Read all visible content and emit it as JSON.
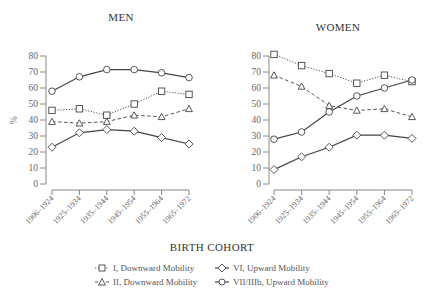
{
  "chart_data": [
    {
      "type": "line",
      "title": "MEN",
      "xlabel": "BIRTH COHORT",
      "ylabel": "%",
      "ylim": [
        0,
        80
      ],
      "yticks": [
        0,
        10,
        20,
        30,
        40,
        50,
        60,
        70,
        80
      ],
      "grid": false,
      "categories": [
        "1906–1924",
        "1925–1934",
        "1935–1944",
        "1945–1954",
        "1955–1964",
        "1965–1972"
      ],
      "series": [
        {
          "name": "I, Downward Mobility",
          "marker": "square",
          "line": "dotted",
          "values": [
            46,
            47,
            43,
            50,
            58,
            56
          ]
        },
        {
          "name": "II, Downward Mobility",
          "marker": "triangle",
          "line": "dashed",
          "values": [
            39,
            38,
            39,
            43,
            42,
            47
          ]
        },
        {
          "name": "VI, Upward Mobility",
          "marker": "diamond",
          "line": "solid",
          "values": [
            23,
            32,
            34,
            33,
            29,
            25
          ]
        },
        {
          "name": "VII/IIIb, Upward Mobility",
          "marker": "circle",
          "line": "solid",
          "values": [
            58,
            67,
            71.5,
            71.5,
            69.5,
            66.5
          ]
        }
      ]
    },
    {
      "type": "line",
      "title": "WOMEN",
      "xlabel": "BIRTH COHORT",
      "ylabel": "",
      "ylim": [
        0,
        80
      ],
      "yticks": [
        0,
        10,
        20,
        30,
        40,
        50,
        60,
        70,
        80
      ],
      "grid": false,
      "categories": [
        "1906–1924",
        "1925–1934",
        "1935–1944",
        "1945–1954",
        "1955–1964",
        "1965–1972"
      ],
      "series": [
        {
          "name": "I, Downward Mobility",
          "marker": "square",
          "line": "dotted",
          "values": [
            81,
            74,
            69,
            63,
            68,
            64
          ]
        },
        {
          "name": "II, Downward Mobility",
          "marker": "triangle",
          "line": "dashed",
          "values": [
            68,
            61,
            49,
            46,
            47,
            42
          ]
        },
        {
          "name": "VI, Upward Mobility",
          "marker": "diamond",
          "line": "solid",
          "values": [
            9,
            17,
            23,
            30.5,
            30.5,
            28.5
          ]
        },
        {
          "name": "VII/IIIb, Upward Mobility",
          "marker": "circle",
          "line": "solid",
          "values": [
            28,
            32.5,
            45,
            55,
            60,
            65
          ]
        }
      ]
    }
  ],
  "shared_xlabel": "BIRTH COHORT",
  "legend": [
    {
      "label": "I, Downward Mobility",
      "marker": "square",
      "line": "dotted"
    },
    {
      "label": "II, Downward Mobility",
      "marker": "triangle",
      "line": "dashed"
    },
    {
      "label": "VI, Upward Mobility",
      "marker": "diamond",
      "line": "solid"
    },
    {
      "label": "VII/IIIb, Upward Mobility",
      "marker": "circle",
      "line": "solid"
    }
  ]
}
